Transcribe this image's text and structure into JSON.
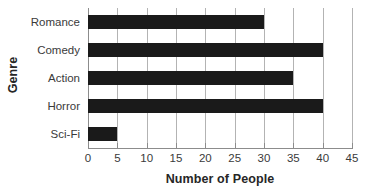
{
  "chart_data": {
    "type": "bar",
    "orientation": "horizontal",
    "title": "",
    "xlabel": "Number of People",
    "ylabel": "Genre",
    "categories": [
      "Romance",
      "Comedy",
      "Action",
      "Horror",
      "Sci-Fi"
    ],
    "values": [
      30,
      40,
      35,
      40,
      5
    ],
    "xlim": [
      0,
      45
    ],
    "xticks": [
      0,
      5,
      10,
      15,
      20,
      25,
      30,
      35,
      40,
      45
    ],
    "xtick_labels": [
      "0",
      "5",
      "10",
      "15",
      "20",
      "25",
      "30",
      "35",
      "40",
      "45"
    ],
    "grid": "vertical",
    "legend": "none",
    "bar_color": "#1a1a1a",
    "gridline_color": "#b3b3b3",
    "axis_color": "#8c8c8c",
    "text_color": "#3a3a3a",
    "title_color": "#262626"
  }
}
